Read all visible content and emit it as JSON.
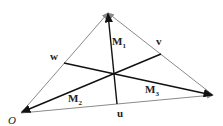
{
  "diagram": {
    "vertices": {
      "O": {
        "x": 21,
        "y": 113
      },
      "A": {
        "x": 108,
        "y": 13
      },
      "B": {
        "x": 213,
        "y": 95
      }
    },
    "midpoints": {
      "u": {
        "x": 117,
        "y": 104
      },
      "v": {
        "x": 161,
        "y": 54
      },
      "w": {
        "x": 64,
        "y": 63
      }
    },
    "centroid": {
      "x": 114,
      "y": 74
    },
    "labels": {
      "origin": "O",
      "u": "u",
      "v": "v",
      "w": "w",
      "m1": "M",
      "m1_sub": "1",
      "m2": "M",
      "m2_sub": "2",
      "m3": "M",
      "m3_sub": "3"
    },
    "colors": {
      "side": "#8a8a8a",
      "median": "#111111"
    }
  }
}
